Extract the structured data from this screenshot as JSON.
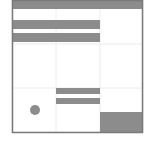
{
  "diagram": {
    "type": "grid-layout-schematic",
    "canvas": {
      "width": 149,
      "height": 143,
      "background": "#ffffff"
    },
    "colors": {
      "fill": "#8c8c8c",
      "frame": "#7a7a7a",
      "gridline": "#ececec"
    },
    "frame": {
      "x": 12,
      "y": 0,
      "width": 131,
      "height": 132
    },
    "grid": {
      "columns": [
        12,
        56,
        100,
        143
      ],
      "rows": [
        0,
        44,
        88,
        132
      ]
    },
    "shapes": [
      {
        "id": "top-bar",
        "kind": "rect",
        "x": 12,
        "y": 0,
        "width": 131,
        "height": 9
      },
      {
        "id": "bar-row1-a",
        "kind": "rect",
        "x": 12,
        "y": 20,
        "width": 88,
        "height": 9
      },
      {
        "id": "bar-row1-b",
        "kind": "rect",
        "x": 12,
        "y": 33,
        "width": 88,
        "height": 9
      },
      {
        "id": "bar-row3-a",
        "kind": "rect",
        "x": 56,
        "y": 88,
        "width": 44,
        "height": 6
      },
      {
        "id": "bar-row3-b",
        "kind": "rect",
        "x": 56,
        "y": 98,
        "width": 44,
        "height": 6
      },
      {
        "id": "dot",
        "kind": "circle",
        "cx": 35,
        "cy": 110,
        "r": 5
      },
      {
        "id": "corner-block",
        "kind": "rect",
        "x": 100,
        "y": 112,
        "width": 43,
        "height": 20
      }
    ]
  }
}
